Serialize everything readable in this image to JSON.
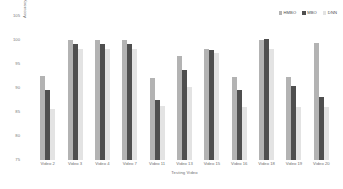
{
  "chart_data": {
    "type": "bar",
    "title": "",
    "xlabel": "Testing Video",
    "ylabel": "Accuracy in %",
    "categories": [
      "Video 2",
      "Video 3",
      "Video 4",
      "Video 7",
      "Video 11",
      "Video 13",
      "Video 15",
      "Video 16",
      "Video 18",
      "Video 19",
      "Video 20"
    ],
    "series": [
      {
        "name": "HMBO",
        "color": "#b3b3b3",
        "values": [
          92.5,
          100.0,
          100.0,
          100.0,
          92.0,
          96.7,
          98.2,
          92.2,
          100.0,
          92.2,
          99.3
        ]
      },
      {
        "name": "MBO",
        "color": "#4f4f4f",
        "values": [
          89.5,
          99.2,
          99.2,
          99.2,
          87.6,
          93.7,
          98.0,
          89.5,
          100.2,
          90.4,
          88.2
        ]
      },
      {
        "name": "DNN",
        "color": "#e3e3e3",
        "values": [
          85.7,
          98.2,
          98.2,
          98.2,
          86.2,
          90.2,
          97.3,
          86.0,
          98.2,
          86.0,
          86.0
        ]
      }
    ],
    "ylim": [
      75,
      105
    ],
    "yticks": [
      105,
      100,
      95,
      90,
      85,
      80,
      75
    ],
    "ytick_labels": [
      "105",
      "100",
      "95",
      "90",
      "85",
      "80",
      "75"
    ],
    "grid": false,
    "legend_position": "top-right",
    "legend": [
      "HMBO",
      "MBO",
      "DNN"
    ]
  }
}
